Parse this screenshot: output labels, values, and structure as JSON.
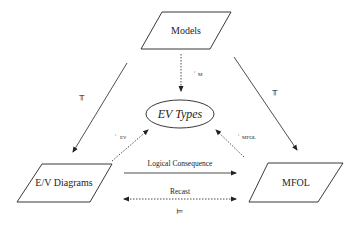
{
  "diagram": {
    "nodes": {
      "models": {
        "label": "Models",
        "shape": "parallelogram"
      },
      "ev_types": {
        "label": "EV Types",
        "shape": "ellipse"
      },
      "ev_diagrams": {
        "label": "E/V Diagrams",
        "shape": "parallelogram"
      },
      "mfol": {
        "label": "MFOL",
        "shape": "parallelogram"
      }
    },
    "edges": {
      "models_to_ev_diagrams": {
        "style": "solid",
        "symbol": "⊨",
        "symbol_label": "models-entails"
      },
      "models_to_mfol": {
        "style": "solid",
        "symbol": "⊨",
        "symbol_label": "models-entails"
      },
      "models_to_ev_types": {
        "style": "dashed",
        "label": "M",
        "marker": ":"
      },
      "ev_diagrams_to_ev_types": {
        "style": "dashed",
        "label": "EV",
        "marker": ":"
      },
      "mfol_to_ev_types": {
        "style": "dashed",
        "label": "MFOL",
        "marker": ":"
      },
      "logical_consequence": {
        "style": "solid",
        "label": "Logical Consequence"
      },
      "recast": {
        "style": "dashed",
        "label": "Recast",
        "bidirectional": true,
        "symbol": "⊨"
      }
    }
  }
}
